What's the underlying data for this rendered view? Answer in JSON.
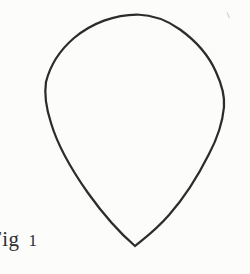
{
  "figure": {
    "caption": {
      "prefix": "Fig",
      "number": "1"
    },
    "curve": {
      "shape": "teardrop-outline",
      "path": "M 137 14.5 C 152 15, 167 20, 180 29.5 C 196 41, 209 56, 216 72 C 222 85, 225 95, 224 107 C 222.5 123, 217 139, 209 154 C 198 176, 184 198, 169 215 C 156 230, 146 237, 135 246 C 121 234, 103 214, 88 193 C 71 169, 57 143, 51 123 C 45.5 106, 44 95, 46 82 C 50 66, 60 50, 74 38 C 92 23, 115 14.5, 137 14.5 Z"
    },
    "colors": {
      "paper_background": "#fcfcfb",
      "ink_line": "#2c2c2c",
      "caption_text": "#2f2f2f"
    }
  }
}
